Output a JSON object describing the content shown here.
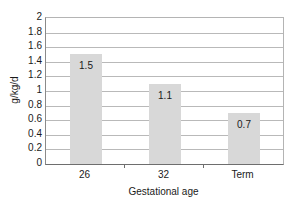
{
  "chart_data": {
    "type": "bar",
    "title": "",
    "subtitle": "",
    "xlabel": "Gestational age",
    "ylabel": "g/kg/d",
    "categories": [
      "26",
      "32",
      "Term"
    ],
    "values": [
      1.5,
      1.1,
      0.7
    ],
    "value_labels": [
      "1.5",
      "1.1",
      "0.7"
    ],
    "series": [
      {
        "name": "",
        "values": [
          1.5,
          1.1,
          0.7
        ]
      }
    ],
    "ylim": [
      0,
      2
    ],
    "xlim": [
      0,
      3
    ],
    "y_ticks": [
      0,
      0.2,
      0.4,
      0.6,
      0.8,
      1,
      1.2,
      1.4,
      1.6,
      1.8,
      2
    ],
    "y_tick_labels": [
      "0",
      "0.2",
      "0.4",
      "0.6",
      "0.8",
      "1",
      "1.2",
      "1.4",
      "1.6",
      "1.8",
      "2"
    ],
    "grid": true,
    "grid_axis": "y",
    "legend": false,
    "legend_position": "none",
    "bar_color": "#d8d8d8",
    "grid_color": "#b9b9b9",
    "axis_color": "#6e6e6e",
    "text_color": "#1a1a1a",
    "background_color": "#ffffff"
  }
}
